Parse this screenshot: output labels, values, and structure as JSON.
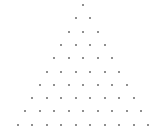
{
  "diagram": {
    "type": "triangular-dot-array",
    "rows": 10,
    "dots_per_row": [
      1,
      2,
      3,
      4,
      5,
      6,
      7,
      8,
      9,
      10
    ],
    "apex": {
      "x": 83,
      "y": 5
    },
    "row_spacing": 13.3,
    "dot_spacing": 14.5,
    "dot_color": "#6a6a6a",
    "background": "#ffffff"
  }
}
